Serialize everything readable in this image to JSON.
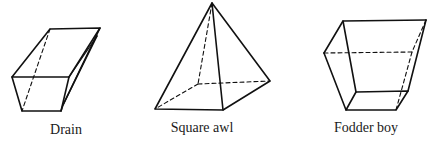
{
  "figure": {
    "stroke_color": "#111111",
    "background": "#ffffff",
    "solids": [
      {
        "id": "drain",
        "label": "Drain",
        "shape": "truncated-wedge",
        "label_x": 66
      },
      {
        "id": "square-awl",
        "label": "Square awl",
        "shape": "square-pyramid",
        "label_x": 202
      },
      {
        "id": "fodder-boy",
        "label": "Fodder boy",
        "shape": "frustum",
        "label_x": 366
      }
    ]
  }
}
